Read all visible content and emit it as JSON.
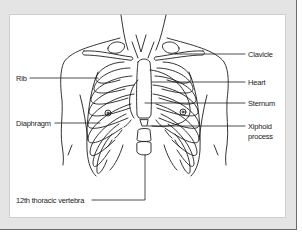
{
  "figure": {
    "labels": {
      "clavicle": "Clavicle",
      "rib": "Rib",
      "heart": "Heart",
      "sternum": "Sternum",
      "diaphragm": "Diaphragm",
      "xiphoid_line1": "Xiphoid",
      "xiphoid_line2": "process",
      "thoracic_vertebra": "12th thoracic vertebra"
    }
  },
  "colors": {
    "frame_background": "#e4e4e4",
    "panel_background": "#ffffff",
    "line_color": "#1e1e1e"
  }
}
